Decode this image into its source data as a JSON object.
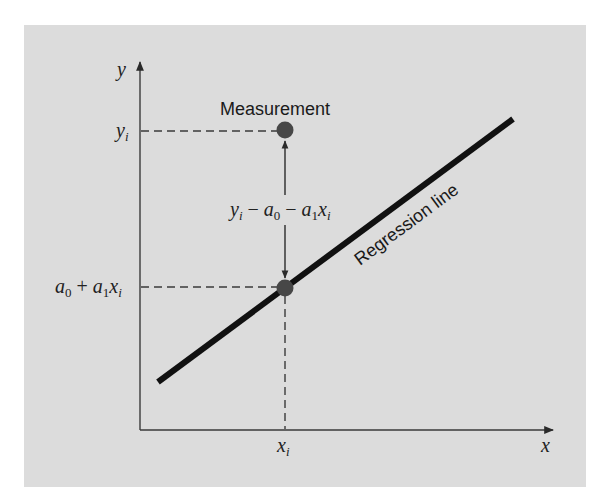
{
  "diagram": {
    "type": "linear-regression-residual",
    "colors": {
      "panel": "#dcdcdc",
      "axis": "#3a3a3a",
      "regression_line": "#111111",
      "points": "#474747",
      "text": "#222222"
    },
    "axes": {
      "x_label": "x",
      "y_label": "y"
    },
    "labels": {
      "measurement": "Measurement",
      "regression_line": "Regression line",
      "y_i": {
        "base": "y",
        "sub": "i"
      },
      "x_i": {
        "base": "x",
        "sub": "i"
      },
      "fitted": {
        "a": "a",
        "sub0": "0",
        "plus": " + ",
        "a1": "a",
        "sub1": "1",
        "x": "x",
        "subi": "i"
      },
      "residual": {
        "y": "y",
        "subi": "i",
        "minus1": " − ",
        "a": "a",
        "sub0": "0",
        "minus2": " − ",
        "a1": "a",
        "sub1": "1",
        "x": "x",
        "subi2": "i"
      }
    },
    "elements": [
      {
        "name": "measurement-point",
        "cx": 285,
        "cy": 130
      },
      {
        "name": "fitted-point",
        "cx": 285,
        "cy": 288
      },
      {
        "name": "regression-line",
        "from": [
          158,
          382
        ],
        "to": [
          513,
          119
        ]
      }
    ]
  }
}
